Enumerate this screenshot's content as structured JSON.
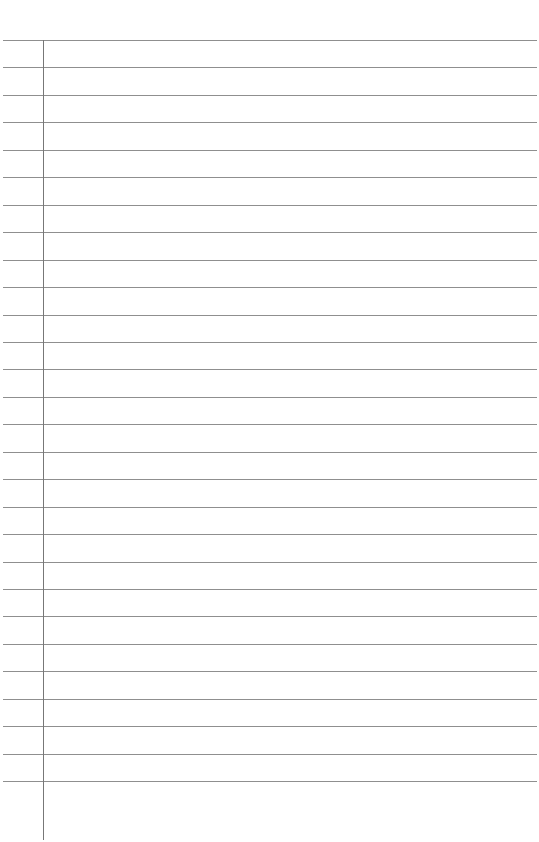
{
  "page": {
    "type": "lined-paper",
    "line_count": 28,
    "first_line_y": 40,
    "line_spacing": 27.45,
    "line_color": "#8f8f8f",
    "margin_line_color": "#777777",
    "background": "#ffffff"
  }
}
